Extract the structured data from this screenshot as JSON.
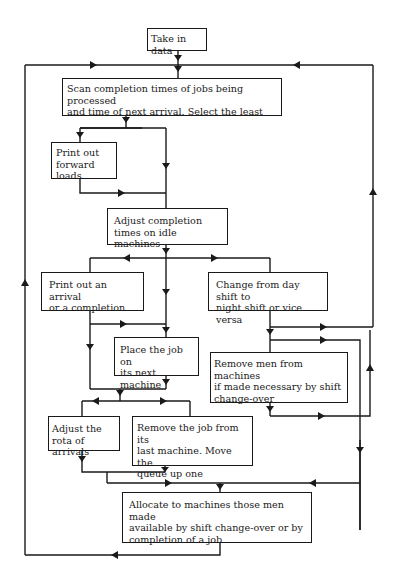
{
  "diagram": {
    "type": "flowchart",
    "nodes": {
      "take_in_data": "Take in data",
      "scan": "Scan completion times of jobs being processed\nand time of next arrival. Select the least",
      "print_forward": "Print out\nforward loads",
      "adjust_completion": "Adjust completion\ntimes on idle machines",
      "print_arrival": "Print out an arrival\nor a completion",
      "change_shift": "Change from day shift to\nnight shift or vice versa",
      "place_job": "Place the job on\nits next machine",
      "remove_men": "Remove men from machines\nif made necessary by shift\nchange-over",
      "adjust_rota": "Adjust the\nrota of arrivals",
      "remove_job": "Remove the job from its\nlast machine. Move the\nqueue up one",
      "allocate": "Allocate to machines those men made\navailable by shift change-over or by\ncompletion of a job"
    },
    "edges": [
      {
        "from": "take_in_data",
        "to": "scan"
      },
      {
        "from": "scan",
        "to": "print_forward"
      },
      {
        "from": "scan",
        "to": "adjust_completion"
      },
      {
        "from": "print_forward",
        "to": "adjust_completion"
      },
      {
        "from": "adjust_completion",
        "to": "print_arrival"
      },
      {
        "from": "adjust_completion",
        "to": "place_job"
      },
      {
        "from": "adjust_completion",
        "to": "change_shift"
      },
      {
        "from": "print_arrival",
        "to": "place_job"
      },
      {
        "from": "print_arrival",
        "to": "adjust_rota"
      },
      {
        "from": "place_job",
        "to": "adjust_rota"
      },
      {
        "from": "place_job",
        "to": "remove_job"
      },
      {
        "from": "change_shift",
        "to": "remove_men"
      },
      {
        "from": "change_shift",
        "to": "scan"
      },
      {
        "from": "change_shift",
        "to": "allocate"
      },
      {
        "from": "remove_men",
        "to": "allocate"
      },
      {
        "from": "adjust_rota",
        "to": "allocate"
      },
      {
        "from": "remove_job",
        "to": "allocate"
      },
      {
        "from": "allocate",
        "to": "scan"
      }
    ],
    "colors": {
      "line": "#1a1a1a",
      "background": "#ffffff"
    }
  }
}
